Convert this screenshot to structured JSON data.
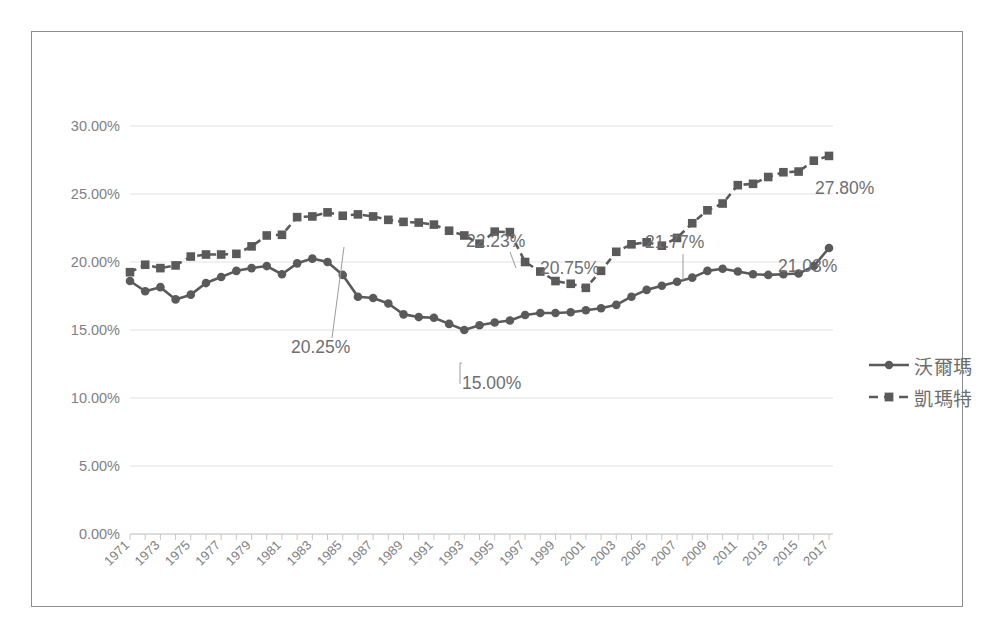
{
  "title": "",
  "legend": {
    "position": "right",
    "items": [
      {
        "label": "沃爾瑪",
        "style": "solid-circle"
      },
      {
        "label": "凱瑪特",
        "style": "dashed-square"
      }
    ]
  },
  "axes": {
    "y_ticks": [
      "0.00%",
      "5.00%",
      "10.00%",
      "15.00%",
      "20.00%",
      "25.00%",
      "30.00%"
    ],
    "x_ticks": [
      "1971",
      "1973",
      "1975",
      "1977",
      "1979",
      "1981",
      "1983",
      "1985",
      "1987",
      "1989",
      "1991",
      "1993",
      "1995",
      "1997",
      "1999",
      "2001",
      "2003",
      "2005",
      "2007",
      "2009",
      "2011",
      "2013",
      "2015",
      "2017"
    ]
  },
  "annotations": [
    {
      "text": "20.25%",
      "series": "沃爾瑪",
      "year": 1983
    },
    {
      "text": "15.00%",
      "series": "沃爾瑪",
      "year": 1993
    },
    {
      "text": "21.03%",
      "series": "沃爾瑪",
      "year": 2017
    },
    {
      "text": "22.23%",
      "series": "凱瑪特",
      "year": 1995
    },
    {
      "text": "20.75%",
      "series": "凱瑪特",
      "year": 2003
    },
    {
      "text": "21.77%",
      "series": "凱瑪特",
      "year": 2007
    },
    {
      "text": "27.80%",
      "series": "凱瑪特",
      "year": 2017
    }
  ],
  "chart_data": {
    "type": "line",
    "title": "",
    "xlabel": "",
    "ylabel": "",
    "ylim": [
      0,
      30
    ],
    "y_tick_step": 5,
    "y_tick_format": "percent",
    "grid": true,
    "legend_position": "right",
    "x": [
      1971,
      1972,
      1973,
      1974,
      1975,
      1976,
      1977,
      1978,
      1979,
      1980,
      1981,
      1982,
      1983,
      1984,
      1985,
      1986,
      1987,
      1988,
      1989,
      1990,
      1991,
      1992,
      1993,
      1994,
      1995,
      1996,
      1997,
      1998,
      1999,
      2000,
      2001,
      2002,
      2003,
      2004,
      2005,
      2006,
      2007,
      2008,
      2009,
      2010,
      2011,
      2012,
      2013,
      2014,
      2015,
      2016,
      2017
    ],
    "series": [
      {
        "name": "沃爾瑪",
        "style": "solid-circle",
        "color": "#5a5a5a",
        "values": [
          18.6,
          17.85,
          18.15,
          17.25,
          17.6,
          18.45,
          18.9,
          19.35,
          19.55,
          19.7,
          19.1,
          19.9,
          20.25,
          20.0,
          19.05,
          17.45,
          17.35,
          16.95,
          16.15,
          15.95,
          15.9,
          15.45,
          15.0,
          15.35,
          15.55,
          15.7,
          16.1,
          16.25,
          16.25,
          16.3,
          16.45,
          16.6,
          16.85,
          17.45,
          17.95,
          18.25,
          18.55,
          18.85,
          19.35,
          19.5,
          19.3,
          19.1,
          19.05,
          19.1,
          19.15,
          19.7,
          21.03
        ]
      },
      {
        "name": "凱瑪特",
        "style": "dashed-square",
        "color": "#5a5a5a",
        "values": [
          19.25,
          19.8,
          19.55,
          19.75,
          20.4,
          20.55,
          20.55,
          20.6,
          21.15,
          21.95,
          22.0,
          23.3,
          23.35,
          23.65,
          23.4,
          23.5,
          23.35,
          23.1,
          22.95,
          22.9,
          22.75,
          22.3,
          21.95,
          21.35,
          22.23,
          22.2,
          20.0,
          19.3,
          18.6,
          18.4,
          18.1,
          19.35,
          20.75,
          21.3,
          21.45,
          21.2,
          21.77,
          22.85,
          23.8,
          24.3,
          25.65,
          25.75,
          26.25,
          26.6,
          26.65,
          27.45,
          27.8
        ]
      }
    ]
  }
}
